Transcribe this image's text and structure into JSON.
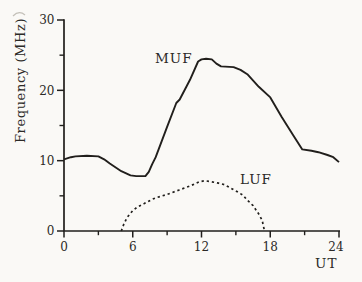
{
  "colors": {
    "ink": "#211f1c",
    "text": "#2b2926",
    "background": "#faf9f6",
    "artifact": "#b5b1a9"
  },
  "chart_data": {
    "type": "line",
    "title": "",
    "xlabel": "UT",
    "ylabel": "Frequency (MHz)",
    "xlim": [
      0,
      24
    ],
    "ylim": [
      0,
      30
    ],
    "grid": false,
    "legend_position": "inline-annotations",
    "x_major_ticks": [
      0,
      6,
      12,
      18,
      24
    ],
    "x_minor_ticks": [
      3,
      9,
      15,
      21
    ],
    "y_major_ticks": [
      0,
      10,
      20,
      30
    ],
    "y_minor_ticks": [
      5,
      15,
      25
    ],
    "series": [
      {
        "name": "MUF",
        "line_style": "solid",
        "points": [
          [
            0,
            10.2
          ],
          [
            0.6,
            10.5
          ],
          [
            1,
            10.6
          ],
          [
            2,
            10.7
          ],
          [
            3,
            10.6
          ],
          [
            3.5,
            10.2
          ],
          [
            4,
            9.6
          ],
          [
            5,
            8.5
          ],
          [
            5.8,
            7.9
          ],
          [
            6.3,
            7.8
          ],
          [
            7.1,
            7.8
          ],
          [
            7.4,
            8.4
          ],
          [
            7.7,
            9.5
          ],
          [
            8,
            10.5
          ],
          [
            9,
            14.8
          ],
          [
            9.8,
            18.2
          ],
          [
            10.1,
            18.7
          ],
          [
            11,
            21.5
          ],
          [
            11.7,
            24.1
          ],
          [
            12,
            24.4
          ],
          [
            12.4,
            24.5
          ],
          [
            12.9,
            24.4
          ],
          [
            13.3,
            23.8
          ],
          [
            13.7,
            23.4
          ],
          [
            14.8,
            23.3
          ],
          [
            15.4,
            22.9
          ],
          [
            16,
            22.3
          ],
          [
            17,
            20.5
          ],
          [
            18,
            19.0
          ],
          [
            19,
            16.2
          ],
          [
            20,
            13.6
          ],
          [
            20.8,
            11.6
          ],
          [
            21.6,
            11.4
          ],
          [
            22.2,
            11.2
          ],
          [
            23,
            10.8
          ],
          [
            23.5,
            10.5
          ],
          [
            24,
            9.8
          ]
        ]
      },
      {
        "name": "LUF",
        "line_style": "dashed",
        "points": [
          [
            5.0,
            0
          ],
          [
            5.2,
            0.9
          ],
          [
            5.5,
            1.9
          ],
          [
            6,
            2.9
          ],
          [
            6.4,
            3.4
          ],
          [
            7,
            3.9
          ],
          [
            7.7,
            4.5
          ],
          [
            8,
            4.7
          ],
          [
            9,
            5.2
          ],
          [
            10,
            5.8
          ],
          [
            11,
            6.4
          ],
          [
            11.8,
            7.0
          ],
          [
            12.3,
            7.15
          ],
          [
            12.9,
            7.0
          ],
          [
            13.5,
            6.8
          ],
          [
            14,
            6.6
          ],
          [
            15,
            5.7
          ],
          [
            15.6,
            5.1
          ],
          [
            16,
            4.4
          ],
          [
            16.5,
            3.6
          ],
          [
            17,
            2.4
          ],
          [
            17.3,
            1.5
          ],
          [
            17.5,
            0
          ]
        ]
      }
    ]
  }
}
